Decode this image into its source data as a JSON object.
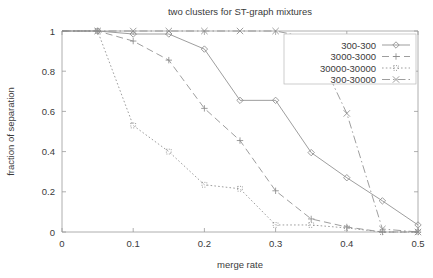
{
  "chart_data": {
    "type": "line",
    "title": "two clusters for ST-graph mixtures",
    "xlabel": "merge rate",
    "ylabel": "fraction of separation",
    "xlim": [
      0,
      0.5
    ],
    "ylim": [
      0,
      1
    ],
    "xticks": [
      "0",
      "0.1",
      "0.2",
      "0.3",
      "0.4",
      "0.5"
    ],
    "xtick_values": [
      0,
      0.1,
      0.2,
      0.3,
      0.4,
      0.5
    ],
    "yticks": [
      "0",
      "0.2",
      "0.4",
      "0.6",
      "0.8",
      "1"
    ],
    "ytick_values": [
      0,
      0.2,
      0.4,
      0.6,
      0.8,
      1
    ],
    "grid": false,
    "legend_position": "top-right",
    "series": [
      {
        "name": "300-300",
        "marker": "diamond",
        "dash": "solid",
        "x": [
          0.0,
          0.05,
          0.1,
          0.15,
          0.2,
          0.25,
          0.3,
          0.35,
          0.4,
          0.45,
          0.5
        ],
        "values": [
          1.0,
          1.0,
          0.985,
          0.985,
          0.91,
          0.655,
          0.655,
          0.395,
          0.27,
          0.155,
          0.035
        ]
      },
      {
        "name": "3000-3000",
        "marker": "plus",
        "dash": "long-dash",
        "x": [
          0.0,
          0.05,
          0.1,
          0.15,
          0.2,
          0.25,
          0.3,
          0.35,
          0.4,
          0.45,
          0.5
        ],
        "values": [
          1.0,
          1.0,
          0.95,
          0.855,
          0.615,
          0.455,
          0.205,
          0.065,
          0.025,
          0.0,
          0.0
        ]
      },
      {
        "name": "30000-30000",
        "marker": "square-dot",
        "dash": "dotted",
        "x": [
          0.0,
          0.05,
          0.1,
          0.15,
          0.2,
          0.25,
          0.3,
          0.35,
          0.4,
          0.45,
          0.5
        ],
        "values": [
          1.0,
          1.0,
          0.53,
          0.4,
          0.235,
          0.215,
          0.035,
          0.035,
          0.02,
          0.0,
          0.0
        ]
      },
      {
        "name": "300-30000",
        "marker": "cross",
        "dash": "dash-dot",
        "x": [
          0.0,
          0.05,
          0.1,
          0.15,
          0.2,
          0.25,
          0.3,
          0.35,
          0.4,
          0.45,
          0.5
        ],
        "values": [
          1.0,
          1.0,
          1.0,
          1.0,
          1.0,
          1.0,
          1.0,
          0.965,
          0.59,
          0.015,
          0.0
        ]
      }
    ]
  },
  "colors": {
    "line": "#8d8d8d",
    "axis": "#9a9a9a",
    "text": "#3a3a3a",
    "background": "#ffffff"
  }
}
